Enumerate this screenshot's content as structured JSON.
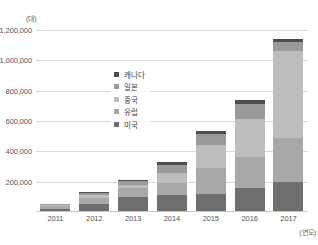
{
  "chart_data": {
    "type": "bar",
    "stacked": true,
    "title": "",
    "subtitle": "",
    "xlabel": "(연도)",
    "ylabel": "(대)",
    "unit_y": "(대)",
    "unit_x": "(연도)",
    "categories": [
      "2011",
      "2012",
      "2013",
      "2014",
      "2015",
      "2016",
      "2017"
    ],
    "series": [
      {
        "name": "미국",
        "color": "#6e6e6e",
        "values": [
          22000,
          52000,
          96000,
          114000,
          116000,
          159000,
          199000
        ]
      },
      {
        "name": "유럽",
        "color": "#a8a8a8",
        "values": [
          16000,
          42000,
          60000,
          80000,
          172000,
          206000,
          287000
        ]
      },
      {
        "name": "중국",
        "color": "#bdbdbd",
        "values": [
          6000,
          16000,
          20000,
          64000,
          152000,
          247000,
          575000
        ]
      },
      {
        "name": "일본",
        "color": "#9a9a9a",
        "values": [
          6000,
          18000,
          28000,
          52000,
          75000,
          100000,
          57000
        ]
      },
      {
        "name": "캐나다",
        "color": "#4d4d4d",
        "values": [
          3000,
          5000,
          10000,
          18000,
          19000,
          26000,
          22000
        ]
      }
    ],
    "totals": [
      53000,
      133000,
      214000,
      328000,
      534000,
      738000,
      1140000
    ],
    "ylim": [
      0,
      1200000
    ],
    "yticks": [
      "200,000",
      "400,000",
      "600,000",
      "800,000",
      "1,000,000",
      "1,200,000"
    ],
    "ytick_values": [
      200000,
      400000,
      600000,
      800000,
      1000000,
      1200000
    ],
    "grid": true,
    "legend_position": "center-left-inside",
    "legend_entries": [
      "캐나다",
      "일본",
      "중국",
      "유럽",
      "미국"
    ]
  }
}
